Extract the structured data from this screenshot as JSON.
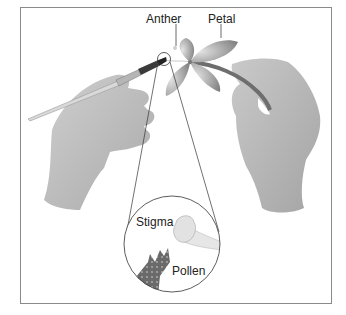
{
  "figure": {
    "labels": {
      "anther": "Anther",
      "petal": "Petal",
      "stigma": "Stigma",
      "pollen": "Pollen"
    },
    "colors": {
      "frame": "#8a8a8a",
      "hand": "#bdbdbd",
      "petal": "#9a9a9a",
      "pollen": "#6e6e6e",
      "line": "#444444"
    }
  }
}
